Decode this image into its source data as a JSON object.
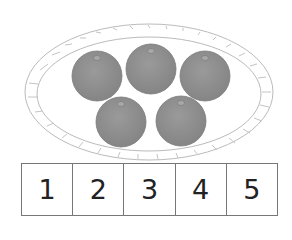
{
  "illustration": {
    "basket": {
      "shape": "oval",
      "style": "woven rim outline"
    },
    "fruit": {
      "count": 5,
      "type": "orange",
      "color": "#8f8f8f"
    }
  },
  "number_strip": {
    "cells": [
      "1",
      "2",
      "3",
      "4",
      "5"
    ]
  }
}
